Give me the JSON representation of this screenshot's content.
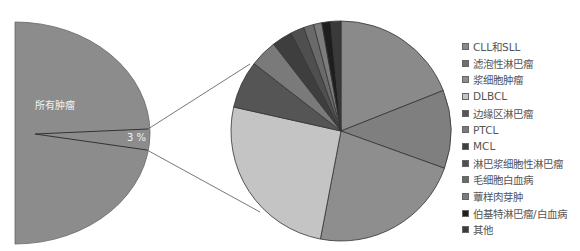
{
  "chart_data": [
    {
      "type": "pie",
      "title": "",
      "description": "Overall tumors (half pie) with lymphoma share exploded",
      "categories": [
        "所有肿瘤",
        "淋巴瘤"
      ],
      "values": [
        97,
        3
      ],
      "slice_label": "3 %",
      "main_label": "所有肿瘤"
    },
    {
      "type": "pie",
      "title": "",
      "legend_position": "right",
      "categories": [
        "CLL和SLL",
        "滤泡性淋巴瘤",
        "浆细胞肿瘤",
        "DLBCL",
        "边缘区淋巴瘤",
        "PTCL",
        "MCL",
        "淋巴浆细胞性淋巴瘤",
        "毛细胞白血病",
        "蕈样肉芽肿",
        "伯基特淋巴瘤/白血病",
        "其他"
      ],
      "values": [
        19,
        11.5,
        22.5,
        25.5,
        7,
        4,
        3,
        2,
        1.5,
        1.2,
        1.3,
        1.5
      ],
      "colors": [
        "#8a8a8a",
        "#7f7f7f",
        "#8e8e8e",
        "#c4c4c4",
        "#555555",
        "#7a7a7a",
        "#3e3e3e",
        "#4f4f4f",
        "#6a6a6a",
        "#7c7c7c",
        "#1e1e1e",
        "#3a3a3a"
      ]
    }
  ],
  "left_pie": {
    "main_label": "所有肿瘤",
    "pct_label": "3 %",
    "color": "#8c8c8c"
  },
  "legend": {
    "items": [
      {
        "label": "CLL和SLL",
        "color": "#8a8a8a"
      },
      {
        "label": "滤泡性淋巴瘤",
        "color": "#6f6f6f"
      },
      {
        "label": "浆细胞肿瘤",
        "color": "#8e8e8e"
      },
      {
        "label": "DLBCL",
        "color": "#c4c4c4"
      },
      {
        "label": "边缘区淋巴瘤",
        "color": "#555555"
      },
      {
        "label": "PTCL",
        "color": "#7a7a7a"
      },
      {
        "label": "MCL",
        "color": "#3e3e3e"
      },
      {
        "label": "淋巴浆细胞性淋巴瘤",
        "color": "#4f4f4f"
      },
      {
        "label": "毛细胞白血病",
        "color": "#6a6a6a"
      },
      {
        "label": "蕈样肉芽肿",
        "color": "#7c7c7c"
      },
      {
        "label": "伯基特淋巴瘤/白血病",
        "color": "#1e1e1e"
      },
      {
        "label": "其他",
        "color": "#3a3a3a"
      }
    ]
  }
}
